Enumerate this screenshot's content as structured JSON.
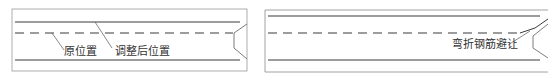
{
  "left_panel": {
    "labels": {
      "original_position": "原位置",
      "adjusted_position": "调整后位置"
    }
  },
  "right_panel": {
    "labels": {
      "bent_rebar_avoidance": "弯折钢筋避让"
    }
  },
  "colors": {
    "line": "#3a3a3a",
    "border": "#8a8a8a",
    "text": "#333333"
  }
}
